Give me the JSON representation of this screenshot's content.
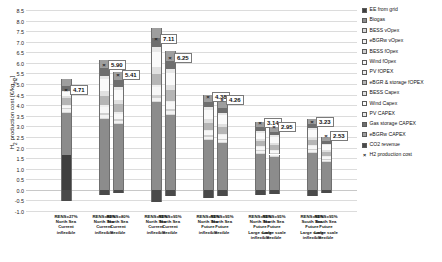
{
  "chart_data": {
    "type": "bar",
    "subtype": "stacked-bar-with-marker",
    "title": "",
    "xlabel": "",
    "ylabel": "H2 production cost [€/kgH2]",
    "ylim": [
      -1.0,
      8.5
    ],
    "ytick_step": 0.5,
    "yticks": [
      "8.5",
      "8.0",
      "7.5",
      "7.0",
      "6.5",
      "6.0",
      "5.5",
      "5.0",
      "4.5",
      "4.0",
      "3.5",
      "3.0",
      "2.5",
      "2.0",
      "1.5",
      "1.0",
      "0.5",
      "0.0",
      "-0.5",
      "-1.0"
    ],
    "grid": true,
    "legend_position": "right",
    "categories": [
      "RENS=27%\nNorth Sea\nCurrent\ninflexible",
      "RENS=80%\nNorth Sea\nCurrent\ninflexible",
      "RENS=80%\nNorth Sea\nCurrent\nflexible",
      "RENS=95%\nNorth Sea\nCurrent\ninflexible",
      "RENS=95%\nNorth Sea\nCurrent\nflexible",
      "RENS=95%\nNorth Sea\nFuture\ninflexible",
      "RENS=95%\nNorth Sea\nFuture\nflexible",
      "RENS=95%\nNorth Sea\nFuture\nLarge scale\ninflexible",
      "RENS=95%\nNorth Sea\nFuture\nLarge scale\nflexible",
      "RENS=95%\nSouth Sea\nFuture\nLarge scale\ninflexible",
      "RENS=95%\nSouth Sea\nFuture\nLarge scale\nflexible"
    ],
    "marker_series": {
      "name": "H2 production cost",
      "values": [
        4.71,
        5.9,
        5.41,
        7.11,
        6.25,
        4.38,
        4.26,
        3.14,
        2.95,
        3.23,
        2.53
      ],
      "labels": [
        "4.71",
        "5.90",
        "5.41",
        "7.11",
        "6.25",
        "4.38",
        "4.26",
        "3.14",
        "2.95",
        "3.23",
        "2.53"
      ]
    },
    "series": [
      {
        "name": "EE from grid",
        "color": "#3f3f3f",
        "values": [
          1.65,
          0.0,
          0.0,
          0.0,
          0.0,
          0.0,
          0.0,
          0.0,
          0.0,
          0.0,
          0.0
        ]
      },
      {
        "name": "Biogas",
        "color": "#8c8c8c",
        "values": [
          2.0,
          3.35,
          3.1,
          4.15,
          3.55,
          2.35,
          2.2,
          1.7,
          1.55,
          1.75,
          1.3
        ]
      },
      {
        "name": "BESS vOpex",
        "color": "#d9d9d9",
        "values": [
          0.05,
          0.05,
          0.05,
          0.05,
          0.05,
          0.05,
          0.05,
          0.04,
          0.04,
          0.04,
          0.04
        ]
      },
      {
        "name": "eBGRw vOpex",
        "color": "#f2f2f2",
        "values": [
          0.12,
          0.14,
          0.12,
          0.16,
          0.14,
          0.1,
          0.1,
          0.08,
          0.08,
          0.09,
          0.07
        ]
      },
      {
        "name": "BESS fOpex",
        "color": "#cfcfcf",
        "values": [
          0.05,
          0.1,
          0.08,
          0.12,
          0.1,
          0.07,
          0.06,
          0.05,
          0.05,
          0.05,
          0.04
        ]
      },
      {
        "name": "Wind fOpex",
        "color": "#f7f7f7",
        "values": [
          0.1,
          0.28,
          0.24,
          0.36,
          0.3,
          0.22,
          0.2,
          0.14,
          0.13,
          0.15,
          0.11
        ]
      },
      {
        "name": "PV fOPEX",
        "color": "#ededed",
        "values": [
          0.04,
          0.08,
          0.07,
          0.1,
          0.08,
          0.06,
          0.05,
          0.04,
          0.04,
          0.04,
          0.03
        ]
      },
      {
        "name": "eBGR & storage fOPEX",
        "color": "#b5b5b5",
        "values": [
          0.35,
          0.45,
          0.4,
          0.55,
          0.48,
          0.33,
          0.31,
          0.24,
          0.22,
          0.25,
          0.19
        ]
      },
      {
        "name": "BESS Capex",
        "color": "#e0e0e0",
        "values": [
          0.08,
          0.22,
          0.18,
          0.3,
          0.24,
          0.16,
          0.15,
          0.11,
          0.1,
          0.12,
          0.09
        ]
      },
      {
        "name": "Wind Capex",
        "color": "#fafafa",
        "values": [
          0.18,
          0.55,
          0.48,
          0.72,
          0.6,
          0.44,
          0.4,
          0.3,
          0.28,
          0.32,
          0.24
        ]
      },
      {
        "name": "PV CAPEX",
        "color": "#e8e8e8",
        "values": [
          0.06,
          0.16,
          0.14,
          0.22,
          0.18,
          0.12,
          0.11,
          0.08,
          0.08,
          0.09,
          0.06
        ]
      },
      {
        "name": "Gas storage CAPEX",
        "color": "#6e6e6e",
        "values": [
          0.25,
          0.36,
          0.32,
          0.44,
          0.38,
          0.26,
          0.24,
          0.19,
          0.17,
          0.2,
          0.15
        ]
      },
      {
        "name": "eBGRw CAPEX",
        "color": "#9e9e9e",
        "values": [
          0.3,
          0.42,
          0.38,
          0.5,
          0.44,
          0.31,
          0.29,
          0.23,
          0.21,
          0.24,
          0.18
        ]
      },
      {
        "name": "CO2 revenue",
        "color": "#4a4a4a",
        "values": [
          -0.52,
          -0.26,
          -0.17,
          -0.56,
          -0.29,
          -0.39,
          -0.3,
          -0.26,
          -0.2,
          -0.3,
          -0.17
        ]
      }
    ]
  },
  "legend": {
    "items": [
      {
        "label": "EE from grid",
        "icon": "swatch-dark"
      },
      {
        "label": "Biogas",
        "icon": "swatch-mid"
      },
      {
        "label": "BESS vOpex",
        "icon": "swatch-light"
      },
      {
        "label": "eBGRw vOpex",
        "icon": "swatch-verylight"
      },
      {
        "label": "BESS fOpex",
        "icon": "swatch-light2"
      },
      {
        "label": "Wind fOpex",
        "icon": "swatch-white"
      },
      {
        "label": "PV fOPEX",
        "icon": "swatch-light3"
      },
      {
        "label": "eBGR & storage fOPEX",
        "icon": "swatch-grey"
      },
      {
        "label": "BESS Capex",
        "icon": "swatch-light4"
      },
      {
        "label": "Wind Capex",
        "icon": "swatch-white2"
      },
      {
        "label": "PV CAPEX",
        "icon": "swatch-light5"
      },
      {
        "label": "Gas storage CAPEX",
        "icon": "swatch-darkgrey"
      },
      {
        "label": "eBGRw CAPEX",
        "icon": "swatch-midgrey"
      },
      {
        "label": "CO2 revenue",
        "icon": "swatch-darkest"
      },
      {
        "label": "H2 production cost",
        "icon": "x-marker-icon"
      }
    ]
  },
  "axis": {
    "y_title_main": "H",
    "y_title_sub": "2",
    "y_title_rest": " production cost [€/kg",
    "y_title_sub2": "H2",
    "y_title_end": "]"
  }
}
